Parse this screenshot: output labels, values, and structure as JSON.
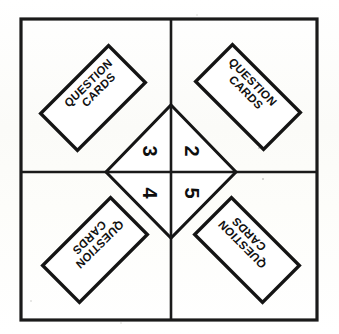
{
  "diagram": {
    "background_color": "#fdfdfb",
    "ink_color": "#141414",
    "frame": {
      "x": 21,
      "y": 19,
      "width": 296,
      "height": 301
    },
    "center": {
      "x": 171,
      "y": 172
    },
    "cards": [
      {
        "id": "card-top-left",
        "quadrant": "top-left",
        "line1": "QUESTION",
        "line2": "CARDS",
        "center_x": 93,
        "center_y": 98,
        "rotation": -45
      },
      {
        "id": "card-top-right",
        "quadrant": "top-right",
        "line1": "QUESTION",
        "line2": "CARDS",
        "center_x": 248,
        "center_y": 97,
        "rotation": 45
      },
      {
        "id": "card-bottom-left",
        "quadrant": "bottom-left",
        "line1": "QUESTION",
        "line2": "CARDS",
        "center_x": 95,
        "center_y": 250,
        "rotation": -225
      },
      {
        "id": "card-bottom-right",
        "quadrant": "bottom-right",
        "line1": "QUESTION",
        "line2": "CARDS",
        "center_x": 247,
        "center_y": 250,
        "rotation": 225
      }
    ],
    "card_size": {
      "width": 96,
      "height": 52
    },
    "diamond": {
      "top_x": 171,
      "top_y": 105,
      "right_x": 236,
      "right_y": 172,
      "bottom_x": 171,
      "bottom_y": 238,
      "left_x": 106,
      "left_y": 172
    },
    "numbers": [
      {
        "id": "number-3",
        "value": "3",
        "position": "upper-left",
        "x": 150,
        "y": 151,
        "rotation": 90
      },
      {
        "id": "number-2",
        "value": "2",
        "position": "upper-right",
        "x": 192,
        "y": 151,
        "rotation": 90
      },
      {
        "id": "number-4",
        "value": "4",
        "position": "lower-left",
        "x": 150,
        "y": 193,
        "rotation": 90
      },
      {
        "id": "number-5",
        "value": "5",
        "position": "lower-right",
        "x": 192,
        "y": 193,
        "rotation": 90
      }
    ]
  }
}
